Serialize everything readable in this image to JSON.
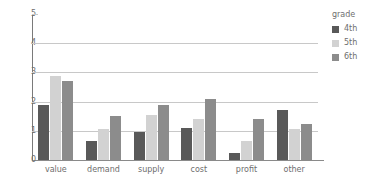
{
  "chart_data": {
    "type": "bar",
    "title": "",
    "xlabel": "",
    "ylabel": "",
    "categories": [
      "value",
      "demand",
      "supply",
      "cost",
      "profit",
      "other"
    ],
    "series": [
      {
        "name": "4th",
        "color": "#595959",
        "values": [
          1.9,
          0.65,
          0.97,
          1.08,
          0.25,
          1.7
        ]
      },
      {
        "name": "5th",
        "color": "#d2d2d2",
        "values": [
          2.87,
          1.07,
          1.55,
          1.4,
          0.65,
          1.07
        ]
      },
      {
        "name": "6th",
        "color": "#8c8c8c",
        "values": [
          2.7,
          1.5,
          1.9,
          2.1,
          1.42,
          1.23
        ]
      }
    ],
    "ylim": [
      0,
      5
    ],
    "yticks": [
      "0",
      "1",
      "2",
      "3",
      "4",
      "5"
    ],
    "grid": true,
    "legend": {
      "title": "grade",
      "position": "right",
      "entries": [
        "4th",
        "5th",
        "6th"
      ]
    }
  }
}
